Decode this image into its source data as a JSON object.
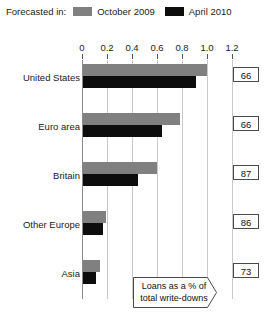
{
  "legend": {
    "title": "Forecasted in:",
    "items": [
      {
        "label": "October 2009",
        "color": "#808080",
        "swatch": "grey-swatch"
      },
      {
        "label": "April 2010",
        "color": "#0d0d0d",
        "swatch": "black-swatch"
      }
    ]
  },
  "annotation": {
    "line1": "Loans as a % of",
    "line2": "total write-downs"
  },
  "chart_data": {
    "type": "bar",
    "title": "",
    "orientation": "horizontal",
    "xlabel": "",
    "ylabel": "",
    "xlim": [
      0,
      1.2
    ],
    "grid": true,
    "legend_position": "top",
    "tick_labels": [
      "0",
      "0.2",
      "0.4",
      "0.6",
      "0.8",
      "1.0",
      "1.2"
    ],
    "tick_values": [
      0,
      0.2,
      0.4,
      0.6,
      0.8,
      1.0,
      1.2
    ],
    "categories": [
      "United States",
      "Euro area",
      "Britain",
      "Other Europe",
      "Asia"
    ],
    "series": [
      {
        "name": "October 2009",
        "color": "#808080",
        "values": [
          1.0,
          0.78,
          0.6,
          0.19,
          0.14
        ]
      },
      {
        "name": "April 2010",
        "color": "#0d0d0d",
        "values": [
          0.91,
          0.64,
          0.45,
          0.17,
          0.11
        ]
      }
    ],
    "side_values": {
      "label": "Loans as a % of total write-downs",
      "values": [
        66,
        66,
        87,
        86,
        73
      ]
    }
  }
}
